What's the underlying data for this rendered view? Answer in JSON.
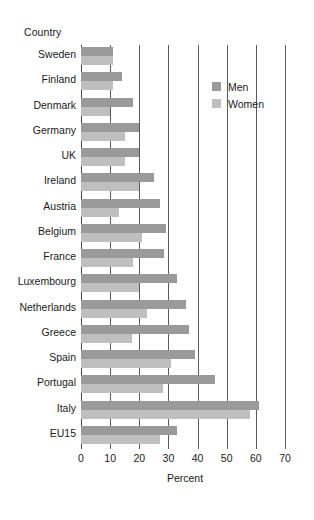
{
  "chart_data": {
    "type": "bar",
    "orientation": "horizontal",
    "title": "",
    "xlabel": "Percent",
    "ylabel": "Country",
    "xlim": [
      0,
      70
    ],
    "xticks": [
      0,
      10,
      20,
      30,
      40,
      50,
      60,
      70
    ],
    "xtick_labels": [
      "0",
      "10",
      "20",
      "30",
      "40",
      "50",
      "60",
      "70"
    ],
    "grid": "vertical",
    "legend_position": "upper-right-inside",
    "categories": [
      "Sweden",
      "Finland",
      "Denmark",
      "Germany",
      "UK",
      "Ireland",
      "Austria",
      "Belgium",
      "France",
      "Luxembourg",
      "Netherlands",
      "Greece",
      "Spain",
      "Portugal",
      "Italy",
      "EU15"
    ],
    "series": [
      {
        "name": "Men",
        "color": "#9a9a9a",
        "values": [
          11,
          14,
          18,
          20,
          20,
          25,
          27,
          29,
          28.5,
          33,
          36,
          37,
          39,
          46,
          61,
          33
        ]
      },
      {
        "name": "Women",
        "color": "#bfbfbf",
        "values": [
          11,
          11,
          10,
          15,
          15,
          20,
          13,
          21,
          18,
          20,
          22.5,
          17.5,
          31,
          28,
          58,
          27
        ]
      }
    ]
  },
  "legend": {
    "entries": [
      {
        "label": "Men",
        "swatch": "men-swatch"
      },
      {
        "label": "Women",
        "swatch": "women-swatch"
      }
    ]
  },
  "colors": {
    "men": "#9a9a9a",
    "women": "#bfbfbf",
    "gridline": "#5b5b5b",
    "text": "#1a1a1a",
    "background": "#ffffff"
  }
}
